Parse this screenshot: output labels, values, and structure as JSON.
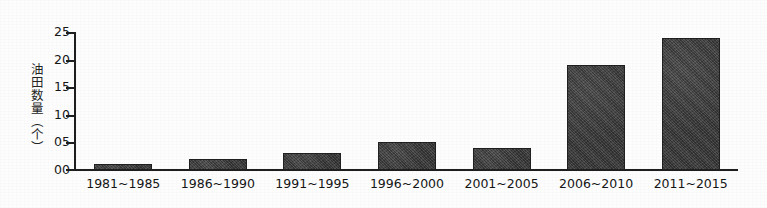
{
  "chart_data": {
    "type": "bar",
    "title": "",
    "subtitle": "",
    "xlabel": "",
    "ylabel": "油田数量（个）",
    "ylabel_chars": [
      "油",
      "田",
      "数",
      "量",
      "（",
      "个",
      "）"
    ],
    "categories": [
      "1981~1985",
      "1986~1990",
      "1991~1995",
      "1996~2000",
      "2001~2005",
      "2006~2010",
      "2011~2015"
    ],
    "values": [
      1,
      2,
      3,
      5,
      4,
      19,
      24
    ],
    "ylim": [
      0,
      25
    ],
    "ytick_values": [
      0,
      5,
      10,
      15,
      20,
      25
    ],
    "ytick_labels": [
      "00",
      "05",
      "10",
      "15",
      "20",
      "25"
    ],
    "grid": false,
    "legend": false,
    "legend_position": "none",
    "bar_color": "#3b3b3b",
    "axis_color": "#1e1e1e",
    "background_color": "#fdfdfd",
    "series": [
      {
        "name": "油田数量",
        "values": [
          1,
          2,
          3,
          5,
          4,
          19,
          24
        ]
      }
    ]
  }
}
